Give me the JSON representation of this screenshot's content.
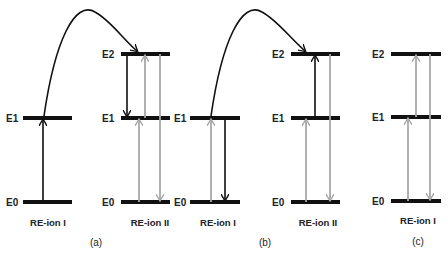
{
  "diagram": {
    "type": "energy-level-diagram",
    "panels": [
      {
        "tag": "(a)",
        "ions": [
          {
            "name": "RE-ion I",
            "levels": [
              "E1",
              "E0"
            ]
          },
          {
            "name": "RE-ion II",
            "levels": [
              "E2",
              "E1",
              "E0"
            ]
          }
        ]
      },
      {
        "tag": "(b)",
        "ions": [
          {
            "name": "RE-ion I",
            "levels": [
              "E1",
              "E0"
            ]
          },
          {
            "name": "RE-ion II",
            "levels": [
              "E2",
              "E1",
              "E0"
            ]
          }
        ]
      },
      {
        "tag": "(c)",
        "ions": [
          {
            "name": "RE-ion I",
            "levels": [
              "E2",
              "E1",
              "E0"
            ]
          }
        ]
      }
    ],
    "colors": {
      "level": "#111111",
      "black_arrow": "#111111",
      "gray_arrow": "#a8a8a8"
    }
  }
}
